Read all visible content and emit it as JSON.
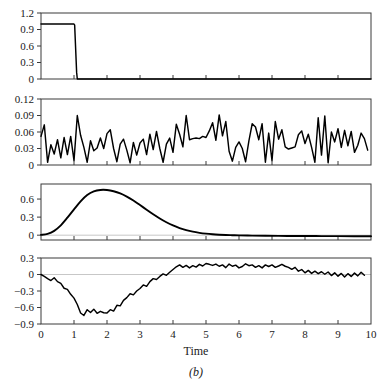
{
  "figure": {
    "caption": "(b)",
    "xlabel": "Time",
    "width": 386,
    "height": 381
  },
  "chart_data": [
    {
      "type": "line",
      "title": "",
      "panel_index": 1,
      "xlabel": "",
      "ylabel": "",
      "xlim": [
        0,
        10
      ],
      "ylim": [
        0,
        1.2
      ],
      "xticks": [
        0,
        1,
        2,
        3,
        4,
        5,
        6,
        7,
        8,
        9,
        10
      ],
      "yticks": [
        0,
        0.3,
        0.6,
        0.9,
        1.2
      ],
      "ytick_labels": [
        "0",
        "0.3",
        "0.6",
        "0.9",
        "1.2"
      ],
      "grid": false,
      "legend": "none",
      "description": "Rectangular input pulse of unit amplitude lasting from t=0 to t=1.05",
      "x": [
        0,
        0.2,
        0.4,
        0.6,
        0.8,
        1.0,
        1.02,
        1.08,
        1.1,
        2,
        4,
        6,
        8,
        10
      ],
      "values": [
        1.0,
        1.0,
        1.0,
        1.0,
        1.0,
        1.0,
        0.98,
        0.12,
        0.0,
        0.0,
        0.0,
        0.0,
        0.0,
        0.0
      ]
    },
    {
      "type": "line",
      "title": "",
      "panel_index": 2,
      "xlabel": "",
      "ylabel": "",
      "xlim": [
        0,
        10
      ],
      "ylim": [
        0,
        0.12
      ],
      "xticks": [
        0,
        1,
        2,
        3,
        4,
        5,
        6,
        7,
        8,
        9,
        10
      ],
      "yticks": [
        0,
        0.03,
        0.06,
        0.09,
        0.12
      ],
      "ytick_labels": [
        "0",
        "0.03",
        "0.06",
        "0.09",
        "0.12"
      ],
      "grid": false,
      "legend": "none",
      "description": "High-frequency non-negative noise sequence fluctuating between 0 and 0.09",
      "x": [
        0.0,
        0.1,
        0.2,
        0.3,
        0.4,
        0.5,
        0.6,
        0.7,
        0.8,
        0.9,
        1.0,
        1.1,
        1.2,
        1.3,
        1.4,
        1.5,
        1.6,
        1.7,
        1.8,
        1.9,
        2.0,
        2.1,
        2.2,
        2.3,
        2.4,
        2.5,
        2.6,
        2.7,
        2.8,
        2.9,
        3.0,
        3.1,
        3.2,
        3.3,
        3.4,
        3.5,
        3.6,
        3.7,
        3.8,
        3.9,
        4.0,
        4.1,
        4.2,
        4.3,
        4.4,
        4.5,
        4.6,
        4.7,
        4.8,
        4.9,
        5.0,
        5.1,
        5.2,
        5.3,
        5.4,
        5.5,
        5.6,
        5.7,
        5.8,
        5.9,
        6.0,
        6.1,
        6.2,
        6.3,
        6.4,
        6.5,
        6.6,
        6.7,
        6.8,
        6.9,
        7.0,
        7.1,
        7.2,
        7.3,
        7.4,
        7.5,
        7.6,
        7.7,
        7.8,
        7.9,
        8.0,
        8.1,
        8.2,
        8.3,
        8.4,
        8.5,
        8.6,
        8.7,
        8.8,
        8.9,
        9.0,
        9.1,
        9.2,
        9.3,
        9.4,
        9.5,
        9.6,
        9.7,
        9.8,
        9.9
      ],
      "values": [
        0.052,
        0.073,
        0.005,
        0.037,
        0.02,
        0.046,
        0.013,
        0.05,
        0.019,
        0.052,
        0.008,
        0.09,
        0.054,
        0.032,
        0.005,
        0.044,
        0.026,
        0.031,
        0.049,
        0.03,
        0.057,
        0.064,
        0.03,
        0.006,
        0.038,
        0.047,
        0.027,
        0.004,
        0.041,
        0.018,
        0.04,
        0.047,
        0.019,
        0.056,
        0.028,
        0.061,
        0.03,
        0.005,
        0.038,
        0.049,
        0.023,
        0.074,
        0.056,
        0.033,
        0.09,
        0.046,
        0.048,
        0.049,
        0.048,
        0.052,
        0.05,
        0.062,
        0.077,
        0.045,
        0.091,
        0.053,
        0.079,
        0.025,
        0.007,
        0.032,
        0.042,
        0.03,
        0.006,
        0.044,
        0.075,
        0.069,
        0.046,
        0.075,
        0.005,
        0.058,
        0.008,
        0.079,
        0.047,
        0.064,
        0.033,
        0.029,
        0.031,
        0.033,
        0.055,
        0.062,
        0.039,
        0.056,
        0.032,
        0.005,
        0.086,
        0.018,
        0.089,
        0.004,
        0.06,
        0.042,
        0.066,
        0.032,
        0.063,
        0.035,
        0.061,
        0.023,
        0.036,
        0.058,
        0.048,
        0.027
      ]
    },
    {
      "type": "line",
      "title": "",
      "panel_index": 3,
      "xlabel": "",
      "ylabel": "",
      "xlim": [
        0,
        10
      ],
      "ylim": [
        -0.08,
        0.85
      ],
      "xticks": [
        0,
        1,
        2,
        3,
        4,
        5,
        6,
        7,
        8,
        9,
        10
      ],
      "yticks": [
        0,
        0.3,
        0.6
      ],
      "ytick_labels": [
        "0",
        "0.3",
        "0.6"
      ],
      "grid": false,
      "legend": "none",
      "description": "Smooth unimodal impulse response peaking at about 0.75 near t=2 and decaying to slightly below zero after t=6",
      "x": [
        0.0,
        0.2,
        0.4,
        0.6,
        0.8,
        1.0,
        1.2,
        1.4,
        1.6,
        1.8,
        2.0,
        2.2,
        2.4,
        2.6,
        2.8,
        3.0,
        3.2,
        3.4,
        3.6,
        3.8,
        4.0,
        4.2,
        4.4,
        4.6,
        4.8,
        5.0,
        5.2,
        5.4,
        5.6,
        5.8,
        6.0,
        6.4,
        6.8,
        7.2,
        7.6,
        8.0,
        8.5,
        9.0,
        9.5,
        10.0
      ],
      "values": [
        0.005,
        0.022,
        0.072,
        0.163,
        0.29,
        0.428,
        0.562,
        0.667,
        0.727,
        0.751,
        0.75,
        0.73,
        0.694,
        0.641,
        0.575,
        0.5,
        0.423,
        0.348,
        0.278,
        0.215,
        0.161,
        0.118,
        0.084,
        0.058,
        0.039,
        0.025,
        0.015,
        0.008,
        0.003,
        0.0,
        -0.003,
        -0.007,
        -0.01,
        -0.012,
        -0.013,
        -0.014,
        -0.015,
        -0.016,
        -0.017,
        -0.018
      ]
    },
    {
      "type": "line",
      "title": "",
      "panel_index": 4,
      "xlabel": "Time",
      "ylabel": "",
      "xlim": [
        0,
        10
      ],
      "ylim": [
        -0.9,
        0.3
      ],
      "xticks": [
        0,
        1,
        2,
        3,
        4,
        5,
        6,
        7,
        8,
        9,
        10
      ],
      "xtick_labels": [
        "0",
        "1",
        "2",
        "3",
        "4",
        "5",
        "6",
        "7",
        "8",
        "9",
        "10"
      ],
      "yticks": [
        -0.9,
        -0.6,
        -0.3,
        0,
        0.3
      ],
      "ytick_labels": [
        "−0.9",
        "−0.6",
        "−0.3",
        "0",
        "0.3"
      ],
      "grid": false,
      "legend": "none",
      "description": "Noisy residual error signal dipping to about -0.75 between t=1 and t=1.7 then recovering to oscillate around zero beyond t=3.5",
      "x": [
        0.0,
        0.1,
        0.2,
        0.3,
        0.4,
        0.5,
        0.6,
        0.7,
        0.8,
        0.9,
        1.0,
        1.1,
        1.2,
        1.3,
        1.4,
        1.5,
        1.6,
        1.7,
        1.8,
        1.9,
        2.0,
        2.1,
        2.2,
        2.3,
        2.4,
        2.5,
        2.6,
        2.7,
        2.8,
        2.9,
        3.0,
        3.1,
        3.2,
        3.3,
        3.4,
        3.5,
        3.6,
        3.7,
        3.8,
        3.9,
        4.0,
        4.1,
        4.2,
        4.3,
        4.4,
        4.5,
        4.6,
        4.7,
        4.8,
        4.9,
        5.0,
        5.1,
        5.2,
        5.3,
        5.4,
        5.5,
        5.6,
        5.7,
        5.8,
        5.9,
        6.0,
        6.1,
        6.2,
        6.3,
        6.4,
        6.5,
        6.6,
        6.7,
        6.8,
        6.9,
        7.0,
        7.1,
        7.2,
        7.3,
        7.4,
        7.5,
        7.6,
        7.7,
        7.8,
        7.9,
        8.0,
        8.1,
        8.2,
        8.3,
        8.4,
        8.5,
        8.6,
        8.7,
        8.8,
        8.9,
        9.0,
        9.1,
        9.2,
        9.3,
        9.4,
        9.5,
        9.6,
        9.7,
        9.8
      ],
      "values": [
        0.0,
        -0.035,
        -0.075,
        -0.11,
        -0.06,
        -0.13,
        -0.16,
        -0.25,
        -0.27,
        -0.36,
        -0.43,
        -0.545,
        -0.7,
        -0.745,
        -0.64,
        -0.69,
        -0.63,
        -0.705,
        -0.67,
        -0.695,
        -0.7,
        -0.64,
        -0.665,
        -0.56,
        -0.57,
        -0.47,
        -0.42,
        -0.35,
        -0.37,
        -0.3,
        -0.255,
        -0.19,
        -0.215,
        -0.13,
        -0.075,
        -0.09,
        -0.035,
        0.01,
        -0.015,
        0.04,
        0.09,
        0.14,
        0.175,
        0.13,
        0.165,
        0.12,
        0.16,
        0.135,
        0.185,
        0.155,
        0.2,
        0.185,
        0.165,
        0.19,
        0.15,
        0.175,
        0.125,
        0.19,
        0.15,
        0.17,
        0.12,
        0.145,
        0.195,
        0.16,
        0.175,
        0.13,
        0.16,
        0.12,
        0.175,
        0.145,
        0.175,
        0.13,
        0.155,
        0.185,
        0.15,
        0.13,
        0.095,
        0.13,
        0.06,
        0.09,
        0.03,
        0.075,
        0.02,
        0.06,
        0.015,
        0.05,
        0.005,
        0.045,
        -0.02,
        0.03,
        -0.03,
        0.02,
        -0.045,
        0.015,
        -0.035,
        0.025,
        -0.025,
        0.04,
        -0.015
      ]
    }
  ]
}
